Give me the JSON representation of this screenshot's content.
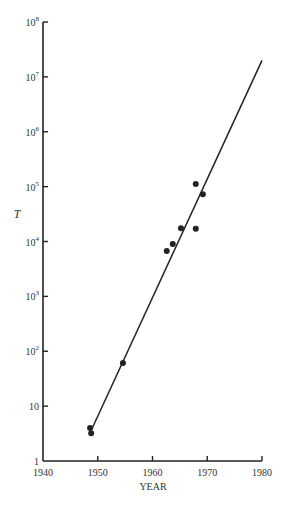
{
  "chart_data": {
    "type": "scatter",
    "title": "",
    "xlabel": "YEAR",
    "ylabel": "T",
    "xscale": "linear",
    "yscale": "log",
    "xlim": [
      1940,
      1980
    ],
    "ylim": [
      1,
      100000000
    ],
    "grid": false,
    "legend": null,
    "x_ticks": [
      1940,
      1950,
      1960,
      1970,
      1980
    ],
    "x_tick_labels": [
      "1940",
      "1950",
      "1960",
      "1970",
      "1980"
    ],
    "y_ticks": [
      1,
      10,
      100,
      1000,
      10000,
      100000,
      1000000,
      10000000,
      100000000
    ],
    "y_tick_labels": [
      {
        "base": "1",
        "exp": ""
      },
      {
        "base": "10",
        "exp": ""
      },
      {
        "base": "10",
        "exp": "2"
      },
      {
        "base": "10",
        "exp": "3"
      },
      {
        "base": "10",
        "exp": "4"
      },
      {
        "base": "10",
        "exp": "5"
      },
      {
        "base": "10",
        "exp": "6"
      },
      {
        "base": "10",
        "exp": "7"
      },
      {
        "base": "10",
        "exp": "8"
      }
    ],
    "series": [
      {
        "name": "observations",
        "kind": "points",
        "points": [
          {
            "x": 1948.6,
            "y": 4.0
          },
          {
            "x": 1948.8,
            "y": 3.2
          },
          {
            "x": 1954.6,
            "y": 61
          },
          {
            "x": 1962.6,
            "y": 6700
          },
          {
            "x": 1963.7,
            "y": 9000
          },
          {
            "x": 1965.2,
            "y": 17500
          },
          {
            "x": 1967.9,
            "y": 17000
          },
          {
            "x": 1967.9,
            "y": 112000
          },
          {
            "x": 1969.2,
            "y": 73000
          }
        ]
      },
      {
        "name": "exponential fit",
        "kind": "line",
        "points": [
          {
            "x": 1949.0,
            "y": 4.0
          },
          {
            "x": 1980.0,
            "y": 20000000
          }
        ]
      }
    ]
  },
  "axes": {
    "x_title": "YEAR",
    "y_title": "T"
  },
  "colors": {
    "ink": "#222222",
    "background": "#ffffff"
  }
}
